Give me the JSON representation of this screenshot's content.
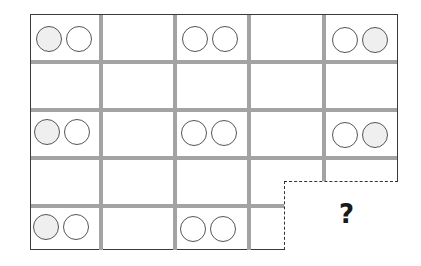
{
  "puzzle": {
    "rows": 5,
    "columns": 5,
    "question_label": "?",
    "colors": {
      "frame": "#3a3a3a",
      "grid_line": "#a3a3a3",
      "circle_stroke": "#555555",
      "circle_gray_fill": "#efefef",
      "circle_white_fill": "#ffffff"
    },
    "cells": [
      {
        "row": 1,
        "col": 1,
        "circles": [
          "gray",
          "white"
        ]
      },
      {
        "row": 1,
        "col": 3,
        "circles": [
          "white",
          "white"
        ]
      },
      {
        "row": 1,
        "col": 5,
        "circles": [
          "white",
          "gray"
        ]
      },
      {
        "row": 3,
        "col": 1,
        "circles": [
          "gray",
          "white"
        ]
      },
      {
        "row": 3,
        "col": 3,
        "circles": [
          "white",
          "white"
        ]
      },
      {
        "row": 3,
        "col": 5,
        "circles": [
          "white",
          "gray"
        ]
      },
      {
        "row": 5,
        "col": 1,
        "circles": [
          "gray",
          "white"
        ]
      },
      {
        "row": 5,
        "col": 3,
        "circles": [
          "white",
          "white"
        ]
      },
      {
        "row": 5,
        "col": 5,
        "circles": [
          "unknown"
        ]
      }
    ]
  }
}
